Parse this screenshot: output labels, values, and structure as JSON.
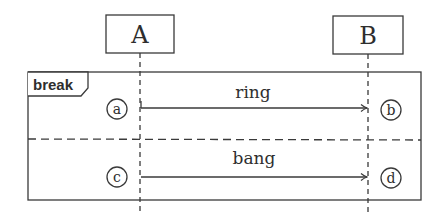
{
  "diagram": {
    "type": "sequence",
    "colors": {
      "stroke": "#3a3a3a",
      "text": "#2e2e2e",
      "background": "#ffffff"
    },
    "participants": [
      {
        "id": "A",
        "label": "A"
      },
      {
        "id": "B",
        "label": "B"
      }
    ],
    "fragment": {
      "operator": "break",
      "sections": [
        {
          "message": {
            "from": "A",
            "to": "B",
            "label": "ring"
          },
          "start_marker": "a",
          "end_marker": "b"
        },
        {
          "message": {
            "from": "A",
            "to": "B",
            "label": "bang"
          },
          "start_marker": "c",
          "end_marker": "d"
        }
      ]
    }
  }
}
